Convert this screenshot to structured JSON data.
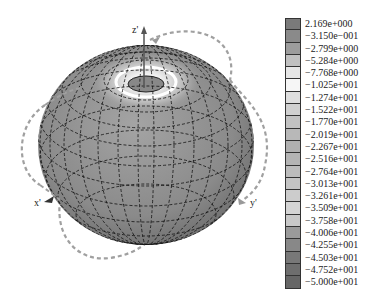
{
  "figure": {
    "type": "3d-radiation-pattern",
    "axes": {
      "z_label": "z'",
      "x_label": "x'",
      "y_label": "y'"
    }
  },
  "colorbar": {
    "entries": [
      {
        "label": "2.169e+000",
        "color": "#7a7a7a"
      },
      {
        "label": "−3.150e−001",
        "color": "#8a8a8a"
      },
      {
        "label": "−2.799e+000",
        "color": "#9c9c9c"
      },
      {
        "label": "−5.284e+000",
        "color": "#c0c0c0"
      },
      {
        "label": "−7.768e+000",
        "color": "#e6e6e6"
      },
      {
        "label": "−1.025e+001",
        "color": "#f6f6f6"
      },
      {
        "label": "−1.274e+001",
        "color": "#dedede"
      },
      {
        "label": "−1.522e+001",
        "color": "#d0d0d0"
      },
      {
        "label": "−1.770e+001",
        "color": "#c2c2c2"
      },
      {
        "label": "−2.019e+001",
        "color": "#b8b8b8"
      },
      {
        "label": "−2.267e+001",
        "color": "#b0b0b0"
      },
      {
        "label": "−2.516e+001",
        "color": "#b4b4b4"
      },
      {
        "label": "−2.764e+001",
        "color": "#bcbcbc"
      },
      {
        "label": "−3.013e+001",
        "color": "#c4c4c4"
      },
      {
        "label": "−3.261e+001",
        "color": "#cccccc"
      },
      {
        "label": "−3.509e+001",
        "color": "#d4d4d4"
      },
      {
        "label": "−3.758e+001",
        "color": "#c8c8c8"
      },
      {
        "label": "−4.006e+001",
        "color": "#9a9a9a"
      },
      {
        "label": "−4.255e+001",
        "color": "#888888"
      },
      {
        "label": "−4.503e+001",
        "color": "#787878"
      },
      {
        "label": "−4.752e+001",
        "color": "#6e6e6e"
      },
      {
        "label": "−5.000e+001",
        "color": "#666666"
      }
    ]
  },
  "colors": {
    "surface": "#8c8c8c",
    "surface_dark": "#6f6f6f",
    "mesh": "#111111",
    "cut_curve": "#a0a0a0",
    "top_ring_light": "#f2f2f2",
    "top_ring_mid": "#cfcfcf"
  }
}
